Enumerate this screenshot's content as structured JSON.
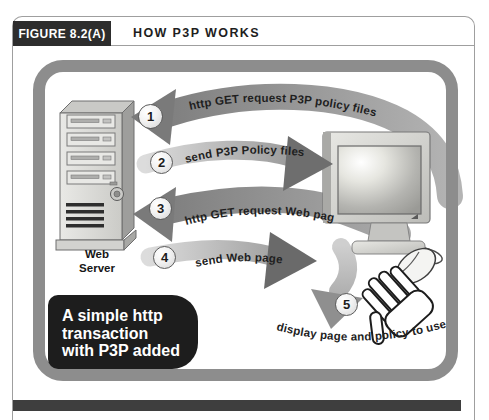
{
  "figure": {
    "label": "FIGURE 8.2(A)",
    "title": "HOW P3P WORKS"
  },
  "diagram": {
    "web_server_label": [
      "Web",
      "Server"
    ],
    "steps": [
      {
        "number": "1",
        "label": "http GET request P3P policy files"
      },
      {
        "number": "2",
        "label": "send P3P Policy files"
      },
      {
        "number": "3",
        "label": "http GET request Web page"
      },
      {
        "number": "4",
        "label": "send Web page"
      },
      {
        "number": "5",
        "label": "display page and policy to user"
      }
    ],
    "caption_lines": [
      "A simple http",
      "transaction",
      "with P3P added"
    ]
  },
  "colors": {
    "figure_label_bg": "#2d2d2d",
    "frame_gray": "#8d8d8d",
    "arrow_dark": "#7a7a7a",
    "arrow_light": "#d8d8d8",
    "caption_bg": "#1d1d1d",
    "divider_bar": "#3e3e3e"
  }
}
